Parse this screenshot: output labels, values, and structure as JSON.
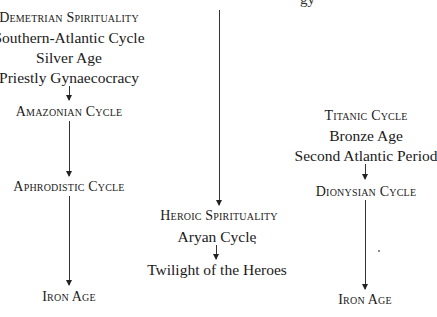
{
  "diagram": {
    "top_cutoff_text": "gy",
    "left_column": {
      "header_lines": [
        "Demetrian Spirituality",
        "Southern-Atlantic Cycle",
        "Silver Age",
        "Priestly Gynaecocracy"
      ],
      "nodes": [
        "Amazonian Cycle",
        "Aphrodistic Cycle",
        "Iron Age"
      ]
    },
    "center_column": {
      "nodes": [
        "Heroic Spirituality",
        "Aryan Cycle",
        "Twilight of the Heroes"
      ]
    },
    "right_column": {
      "header_lines": [
        "Titanic Cycle",
        "Bronze Age",
        "Second Atlantic Period"
      ],
      "nodes": [
        "Dionysian Cycle",
        "Iron Age"
      ]
    }
  }
}
